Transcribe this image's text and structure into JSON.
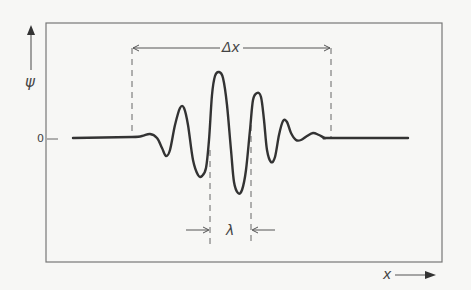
{
  "figure": {
    "type": "wave-packet diagram",
    "y_axis": {
      "label": "ψ",
      "zero_tick": "0"
    },
    "x_axis": {
      "label": "x"
    },
    "annotations": {
      "packet_width": "Δx",
      "wavelength": "λ"
    },
    "colors": {
      "background": "#f7f7f5",
      "frame": "#777777",
      "curve": "#333333",
      "dashed": "#666666",
      "text": "#444444"
    },
    "curve_points": [
      [
        73,
        138
      ],
      [
        132,
        137
      ],
      [
        142,
        136
      ],
      [
        150,
        134
      ],
      [
        157,
        138
      ],
      [
        162,
        148
      ],
      [
        166,
        156
      ],
      [
        170,
        150
      ],
      [
        175,
        125
      ],
      [
        180,
        108
      ],
      [
        184,
        108
      ],
      [
        188,
        125
      ],
      [
        193,
        160
      ],
      [
        198,
        175
      ],
      [
        202,
        176
      ],
      [
        206,
        168
      ],
      [
        209,
        140
      ],
      [
        212,
        95
      ],
      [
        215,
        76
      ],
      [
        219,
        72
      ],
      [
        223,
        78
      ],
      [
        227,
        105
      ],
      [
        231,
        150
      ],
      [
        234,
        182
      ],
      [
        238,
        193
      ],
      [
        242,
        190
      ],
      [
        246,
        170
      ],
      [
        250,
        130
      ],
      [
        253,
        100
      ],
      [
        257,
        93
      ],
      [
        261,
        97
      ],
      [
        264,
        120
      ],
      [
        267,
        150
      ],
      [
        271,
        162
      ],
      [
        275,
        157
      ],
      [
        279,
        135
      ],
      [
        283,
        121
      ],
      [
        287,
        122
      ],
      [
        291,
        133
      ],
      [
        296,
        140
      ],
      [
        301,
        140
      ],
      [
        307,
        136
      ],
      [
        313,
        133
      ],
      [
        319,
        135
      ],
      [
        325,
        138
      ],
      [
        331,
        138
      ],
      [
        408,
        138
      ]
    ]
  }
}
